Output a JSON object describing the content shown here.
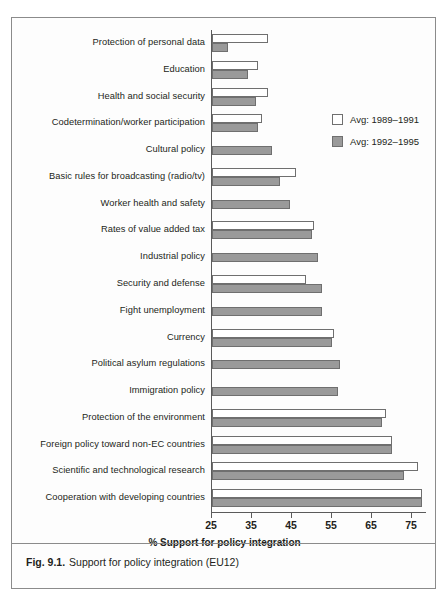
{
  "top_strip_text": "",
  "caption": {
    "figure_number": "Fig. 9.1.",
    "text": "Support for policy integration (EU12)"
  },
  "legend": {
    "position": "inside-top-right",
    "items": [
      {
        "label": "Avg: 1989–1991",
        "swatch": "white-square-icon",
        "color": "#ffffff"
      },
      {
        "label": "Avg: 1992–1995",
        "swatch": "gray-square-icon",
        "color": "#9a9a9a"
      }
    ]
  },
  "chart_data": {
    "type": "bar",
    "orientation": "horizontal",
    "title": "",
    "subtitle": "",
    "xlabel": "% Support for policy integration",
    "ylabel": "",
    "xlim": [
      25,
      78
    ],
    "xticks": [
      25,
      35,
      45,
      55,
      65,
      75
    ],
    "xtick_labels": [
      "25",
      "35",
      "45",
      "55",
      "65",
      "75"
    ],
    "grid": false,
    "legend_position": "inside-top-right",
    "categories": [
      "Protection of personal data",
      "Education",
      "Health and social security",
      "Codetermination/worker participation",
      "Cultural policy",
      "Basic rules for broadcasting (radio/tv)",
      "Worker health and safety",
      "Rates of value added tax",
      "Industrial policy",
      "Security and defense",
      "Fight unemployment",
      "Currency",
      "Political asylum regulations",
      "Immigration policy",
      "Protection of the environment",
      "Foreign policy toward non-EC countries",
      "Scientific and technological research",
      "Cooperation with developing countries"
    ],
    "series": [
      {
        "name": "Avg: 1989–1991",
        "color": "#ffffff",
        "values": [
          39,
          36.5,
          39,
          37.5,
          null,
          46,
          null,
          50.5,
          null,
          48.5,
          null,
          55.5,
          null,
          null,
          68.5,
          70,
          76.5,
          77.5
        ]
      },
      {
        "name": "Avg: 1992–1995",
        "color": "#9a9a9a",
        "values": [
          29,
          34,
          36,
          36.5,
          40,
          42,
          44.5,
          50,
          51.5,
          52.5,
          52.5,
          55,
          57,
          56.5,
          67.5,
          70,
          73,
          77.5
        ]
      }
    ]
  }
}
